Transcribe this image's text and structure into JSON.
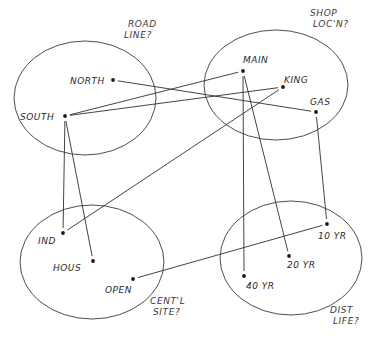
{
  "diagram": {
    "groups": [
      {
        "id": "road",
        "cx": 85,
        "cy": 98,
        "rx": 71,
        "ry": 57,
        "note": [
          "ROAD",
          "LINE?"
        ],
        "note_x": 128,
        "note_y": 27
      },
      {
        "id": "shop",
        "cx": 276,
        "cy": 85,
        "rx": 72,
        "ry": 55,
        "note": [
          "SHOP",
          "LOC'N?"
        ],
        "note_x": 310,
        "note_y": 16
      },
      {
        "id": "sites",
        "cx": 92,
        "cy": 262,
        "rx": 72,
        "ry": 57,
        "note": [
          "CENT'L",
          "SITE?"
        ],
        "note_x": 150,
        "note_y": 304
      },
      {
        "id": "life",
        "cx": 291,
        "cy": 258,
        "rx": 71,
        "ry": 57,
        "note": [
          "DIST",
          "LIFE?"
        ],
        "note_x": 330,
        "note_y": 313
      }
    ],
    "nodes": [
      {
        "id": "north",
        "label": "NORTH",
        "x": 113,
        "y": 80,
        "lx": 70,
        "ly": 84
      },
      {
        "id": "south",
        "label": "SOUTH",
        "x": 65,
        "y": 116,
        "lx": 20,
        "ly": 120
      },
      {
        "id": "main",
        "label": "MAIN",
        "x": 243,
        "y": 71,
        "lx": 243,
        "ly": 63
      },
      {
        "id": "king",
        "label": "KING",
        "x": 283,
        "y": 87,
        "lx": 284,
        "ly": 83
      },
      {
        "id": "gas",
        "label": "GAS",
        "x": 316,
        "y": 112,
        "lx": 310,
        "ly": 105
      },
      {
        "id": "ind",
        "label": "IND",
        "x": 63,
        "y": 233,
        "lx": 38,
        "ly": 244
      },
      {
        "id": "hous",
        "label": "HOUS",
        "x": 93,
        "y": 261,
        "lx": 53,
        "ly": 271
      },
      {
        "id": "open",
        "label": "OPEN",
        "x": 133,
        "y": 279,
        "lx": 105,
        "ly": 293
      },
      {
        "id": "yr10",
        "label": "10 YR",
        "x": 327,
        "y": 224,
        "lx": 318,
        "ly": 239
      },
      {
        "id": "yr20",
        "label": "20 YR",
        "x": 289,
        "y": 256,
        "lx": 287,
        "ly": 268
      },
      {
        "id": "yr40",
        "label": "40 YR",
        "x": 244,
        "y": 276,
        "lx": 246,
        "ly": 289
      }
    ],
    "edges": [
      {
        "from": "north",
        "to": "gas"
      },
      {
        "from": "south",
        "to": "main"
      },
      {
        "from": "south",
        "to": "king"
      },
      {
        "from": "south",
        "to": "ind"
      },
      {
        "from": "south",
        "to": "hous"
      },
      {
        "from": "king",
        "to": "ind"
      },
      {
        "from": "main",
        "to": "yr40"
      },
      {
        "from": "main",
        "to": "yr20"
      },
      {
        "from": "gas",
        "to": "yr10"
      },
      {
        "from": "open",
        "to": "yr10"
      }
    ]
  }
}
